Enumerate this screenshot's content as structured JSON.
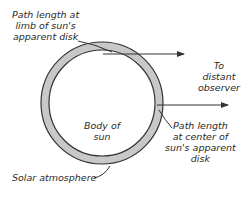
{
  "diagram": {
    "labels": {
      "limb_path": [
        "Path length at",
        "limb of sun's",
        "apparent disk"
      ],
      "observer": [
        "To",
        "distant",
        "observer"
      ],
      "body": [
        "Body of",
        "sun"
      ],
      "center_path": [
        "Path length",
        "at center of",
        "sun's apparent",
        "disk"
      ],
      "atmosphere": "Solar atmosphere"
    },
    "colors": {
      "atmosphere_fill": "#c8c8c8",
      "outline": "#333333",
      "background": "#ffffff"
    }
  }
}
